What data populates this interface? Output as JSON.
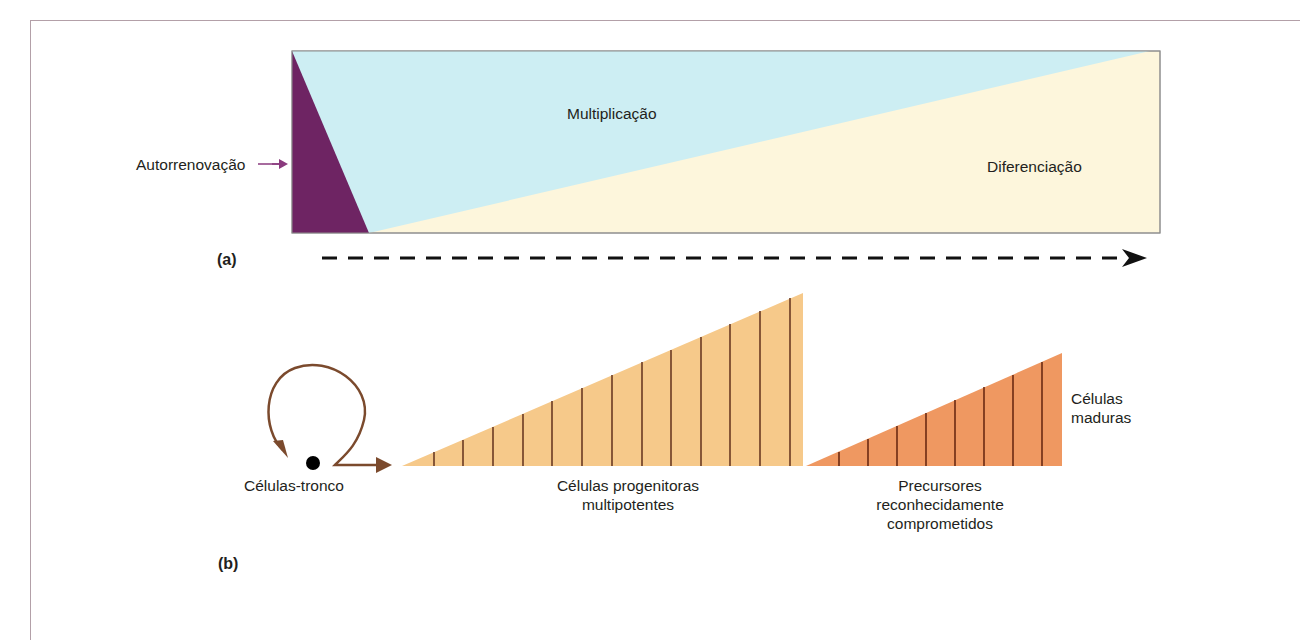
{
  "panel_a": {
    "label": "(a)",
    "regions": {
      "self_renewal": {
        "label": "Autorrenovação",
        "color": "#6e2463"
      },
      "multiplication": {
        "label": "Multiplicação",
        "color": "#cdeef3"
      },
      "differentiation": {
        "label": "Diferenciação",
        "color": "#fdf6dc"
      }
    },
    "arrow_color": "#8a3a7e",
    "timeline_arrow": "dashed-right-arrow"
  },
  "panel_b": {
    "label": "(b)",
    "stem_cells": {
      "label": "Células-tronco",
      "loop_color": "#7b4a2d"
    },
    "progenitors": {
      "label_line1": "Células progenitoras",
      "label_line2": "multipotentes",
      "color": "#f6c98a",
      "stripe_count": 13
    },
    "precursors": {
      "label_line1": "Precursores",
      "label_line2": "reconhecidamente",
      "label_line3": "comprometidos",
      "color": "#ef9861",
      "stripe_count": 9
    },
    "mature": {
      "label_line1": "Células",
      "label_line2": "maduras"
    }
  },
  "frame_color": "#b3a0a8"
}
